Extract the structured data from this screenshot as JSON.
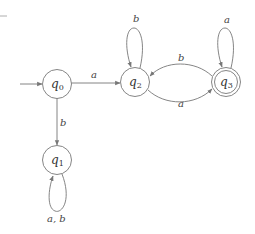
{
  "diagram": {
    "type": "finite-automaton",
    "start_state": "q0",
    "accept_states": [
      "q3"
    ],
    "colors": {
      "stroke": "#777777",
      "text": "#333333",
      "background": "#ffffff"
    },
    "states": [
      {
        "id": "q0",
        "label_main": "q",
        "label_sub": "0",
        "accepting": false
      },
      {
        "id": "q1",
        "label_main": "q",
        "label_sub": "1",
        "accepting": false
      },
      {
        "id": "q2",
        "label_main": "q",
        "label_sub": "2",
        "accepting": false
      },
      {
        "id": "q3",
        "label_main": "q",
        "label_sub": "3",
        "accepting": true
      }
    ],
    "transitions": [
      {
        "from": "q0",
        "to": "q2",
        "label": "a"
      },
      {
        "from": "q0",
        "to": "q1",
        "label": "b"
      },
      {
        "from": "q1",
        "to": "q1",
        "label": "a, b"
      },
      {
        "from": "q2",
        "to": "q2",
        "label": "b"
      },
      {
        "from": "q2",
        "to": "q3",
        "label": "a"
      },
      {
        "from": "q3",
        "to": "q2",
        "label": "b"
      },
      {
        "from": "q3",
        "to": "q3",
        "label": "a"
      }
    ]
  }
}
